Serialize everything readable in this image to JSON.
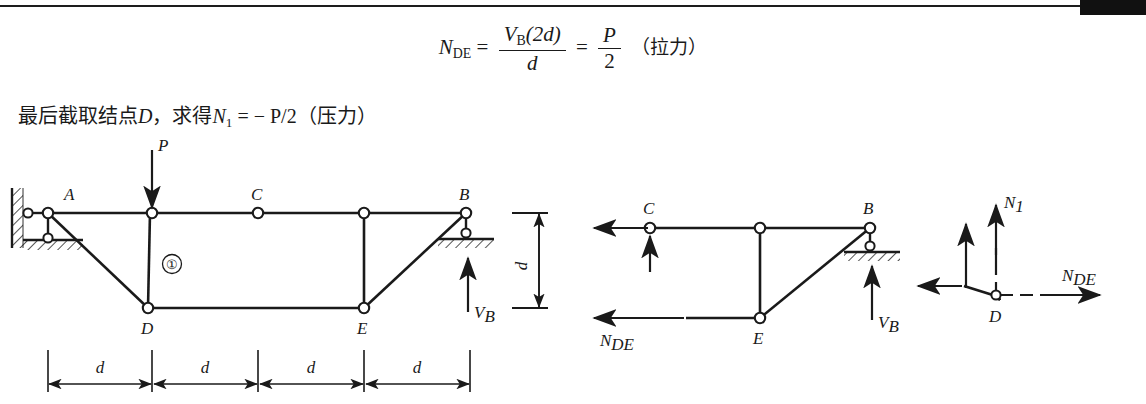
{
  "page": {
    "equation": {
      "lhs": "N",
      "lhs_sub": "DE",
      "eq1": "=",
      "num_v": "V",
      "num_v_sub": "B",
      "num_rest": "(2d)",
      "den": "d",
      "eq2": "=",
      "frac2_num": "P",
      "frac2_den": "2",
      "tail_cjk": "（拉力）"
    },
    "sentence": {
      "cjk_lead": "最后截取结点",
      "node": "D",
      "cjk_comma": "，求得",
      "var": "N",
      "var_sub": "1",
      "equals": "= − P/2",
      "cjk_tail": "（压力）"
    }
  },
  "figure1": {
    "caption_nodes": {
      "A": "A",
      "B": "B",
      "C": "C",
      "D": "D",
      "E": "E"
    },
    "load_label": "P",
    "member_label": "①",
    "reaction": {
      "symbol": "V",
      "sub": "B"
    },
    "dim_h": [
      "d",
      "d",
      "d",
      "d"
    ],
    "dim_v": "d"
  },
  "figure2": {
    "nodes": {
      "C": "C",
      "B": "B",
      "E": "E"
    },
    "force_nde": {
      "symbol": "N",
      "sub": "DE"
    },
    "reaction": {
      "symbol": "V",
      "sub": "B"
    }
  },
  "figure3": {
    "node": "D",
    "force_n1": {
      "symbol": "N",
      "sub": "1"
    },
    "force_nde": {
      "symbol": "N",
      "sub": "DE"
    }
  },
  "style": {
    "ink": "#1a1a1a",
    "paper": "#ffffff",
    "bar": "#111111"
  }
}
